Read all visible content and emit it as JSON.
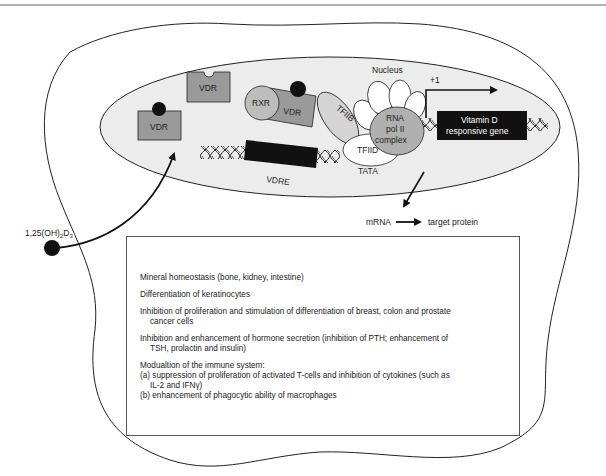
{
  "diagram": {
    "nucleus_label": "Nucleus",
    "ligand": {
      "label_prefix": "1,25(OH)",
      "label_sub1": "2",
      "label_mid": "D",
      "label_sub2": "3"
    },
    "proteins": {
      "vdr_free": "VDR",
      "vdr_bound": "VDR",
      "rxr": "RXR",
      "vdr_complex": "VDR",
      "tfiib": "TFIIB",
      "rna_pol_line1": "RNA",
      "rna_pol_line2": "pol II",
      "rna_pol_line3": "complex",
      "tfiid": "TFIID"
    },
    "dna": {
      "vdre": "VDRE",
      "tata": "TATA",
      "start_site": "+1",
      "gene_line1": "Vitamin D",
      "gene_line2": "responsive gene"
    },
    "output": {
      "mrna": "mRNA",
      "target": "target protein"
    },
    "colors": {
      "nucleus_fill": "#ececec",
      "receptor_fill": "#9a9a9a",
      "rxr_fill": "#bdbdbd",
      "tfiib_fill": "#d4d4d4",
      "rnapol_fill": "#b0b0b0",
      "dark": "#111111"
    }
  },
  "effects": {
    "item1": "Mineral homeostasis (bone, kidney, intestine)",
    "item2": "Differentiation of keratinocytes",
    "item3_line1": "Inhibition of proliferation and stimulation of differentiation of breast, colon and prostate",
    "item3_line2": "cancer cells",
    "item4_line1": "Inhibition and enhancement of hormone secretion (inhibition of PTH; enhancement of",
    "item4_line2": "TSH, prolactin and insulin)",
    "item5_title": "Modualtion of the immune system:",
    "item5_a_line1": "(a) suppression of proliferation of activated T-cells and inhibition of cytokines (such as",
    "item5_a_line2": "IL-2 and IFNγ)",
    "item5_b": "(b) enhancement of phagocytic ability of macrophages"
  }
}
